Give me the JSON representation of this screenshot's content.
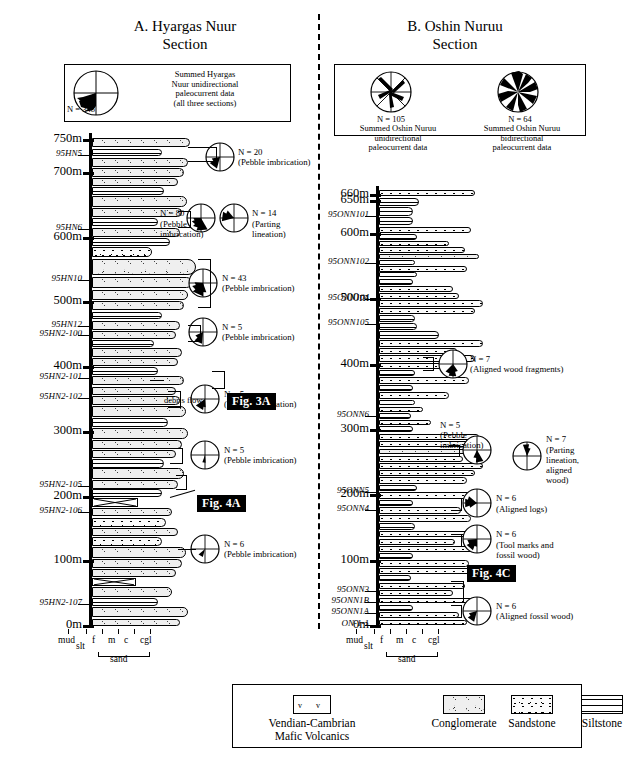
{
  "figure": {
    "left_section_title": "A. Hyargas Nuur\nSection",
    "right_section_title": "B. Oshin Nuruu\nSection"
  },
  "left_rose_box": {
    "n_label": "N = 348",
    "caption": "Summed Hyargas\nNuur unidirectional\npaleocurrent data\n(all three sections)"
  },
  "right_rose_box": {
    "roses": [
      {
        "n_label": "N =  105",
        "caption": "Summed Oshin Nuruu\nunidirectional\npaleocurrent data"
      },
      {
        "n_label": "N =  64",
        "caption": "Summed Oshin Nuruu\nbidirectional\npaleocurrent data"
      }
    ]
  },
  "left_column": {
    "depth_ticks": [
      "750m",
      "700m",
      "600m",
      "500m",
      "400m",
      "300m",
      "200m",
      "100m",
      "0m"
    ],
    "samples": [
      "95HN5",
      "95HN6",
      "95HN10",
      "95HN12",
      "95HN2-100",
      "95HN2-101",
      "95HN2-102",
      "95HN2-105",
      "95HN2-106",
      "95HN2-107"
    ],
    "annotations": [
      {
        "n": "N = 20",
        "desc": "(Pebble imbrication)"
      },
      {
        "n": "N = 80",
        "desc": "(Pebble\nimbrication)"
      },
      {
        "n": "N = 14",
        "desc": "(Parting\nlineation)"
      },
      {
        "n": "N = 43",
        "desc": "(Pebble imbrication)"
      },
      {
        "n": "N = 5",
        "desc": "(Pebble imbrication)"
      },
      {
        "n": "N = 5",
        "desc": "(Pebble imbrication)"
      },
      {
        "n": "N = 5",
        "desc": "(Pebble imbrication)"
      },
      {
        "n": "N = 6",
        "desc": "(Pebble imbrication)"
      }
    ],
    "debris_flow_label": "debris flow",
    "fig_boxes": [
      "Fig. 3A",
      "Fig. 4A"
    ],
    "grain_scale": {
      "labels": [
        "mud",
        "slt",
        "f",
        "m",
        "c",
        "cgl"
      ],
      "bracket_label": "sand"
    }
  },
  "right_column": {
    "depth_ticks": [
      "660m",
      "650m",
      "600m",
      "500m",
      "400m",
      "300m",
      "200m",
      "100m",
      "0m"
    ],
    "samples": [
      "95ONN101",
      "95ONN102",
      "95ONN104",
      "95ONN105",
      "95ONN6",
      "95ONN5",
      "95ONN4",
      "95ONN3",
      "95ONN1B",
      "95ONN1A",
      "ON-1-1"
    ],
    "annotations": [
      {
        "n": "N = 7",
        "desc": "(Aligned wood fragments)"
      },
      {
        "n": "N = 5",
        "desc": "(Pebble\nimbrication)"
      },
      {
        "n": "N = 7",
        "desc": "(Parting\nlineation,\naligned\nwood)"
      },
      {
        "n": "N = 6",
        "desc": "(Aligned logs)"
      },
      {
        "n": "N = 6",
        "desc": "(Tool marks and\nfossil wood)"
      },
      {
        "n": "N = 6",
        "desc": "(Aligned fossil wood)"
      }
    ],
    "fig_boxes": [
      "Fig. 4C"
    ],
    "grain_scale": {
      "labels": [
        "mud",
        "slt",
        "f",
        "m",
        "c",
        "cgl"
      ],
      "bracket_label": "sand"
    }
  },
  "legend": {
    "items": [
      {
        "label": "Vendian-Cambrian\nMafic Volcanics",
        "pattern": "volcanics"
      },
      {
        "label": "Conglomerate",
        "pattern": "conglomerate"
      },
      {
        "label": "Sandstone",
        "pattern": "sandstone"
      },
      {
        "label": "Siltstone",
        "pattern": "siltstone"
      }
    ]
  },
  "colors": {
    "ink": "#000000",
    "paper": "#ffffff",
    "fill_light": "#efefef"
  }
}
